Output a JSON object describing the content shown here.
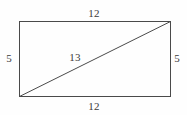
{
  "figure": {
    "kind": "geometry-diagram",
    "shape": "rectangle-with-diagonal",
    "background_color": "#fefefe",
    "stroke_color": "#4a4a4a",
    "stroke_width": 1,
    "label_color": "#3a3a3a",
    "rect": {
      "left": 19,
      "top": 21,
      "right": 170,
      "bottom": 96,
      "width": 151,
      "height": 75
    },
    "diagonal": {
      "x1": 19,
      "y1": 96,
      "x2": 170,
      "y2": 21
    },
    "labels": [
      {
        "name": "top-side-length",
        "text": "12",
        "x": 94,
        "y": 13
      },
      {
        "name": "left-side-length",
        "text": "5",
        "x": 9,
        "y": 58
      },
      {
        "name": "diagonal-length",
        "text": "13",
        "x": 75,
        "y": 57
      },
      {
        "name": "right-side-length",
        "text": "5",
        "x": 177,
        "y": 58
      },
      {
        "name": "bottom-side-length",
        "text": "12",
        "x": 94,
        "y": 106
      }
    ]
  },
  "chart_data": {
    "type": "diagram",
    "title": "",
    "edges": [
      {
        "id": "top",
        "label": "12",
        "value": 12
      },
      {
        "id": "bottom",
        "label": "12",
        "value": 12
      },
      {
        "id": "left",
        "label": "5",
        "value": 5
      },
      {
        "id": "right",
        "label": "5",
        "value": 5
      },
      {
        "id": "diagonal",
        "label": "13",
        "value": 13
      }
    ]
  }
}
